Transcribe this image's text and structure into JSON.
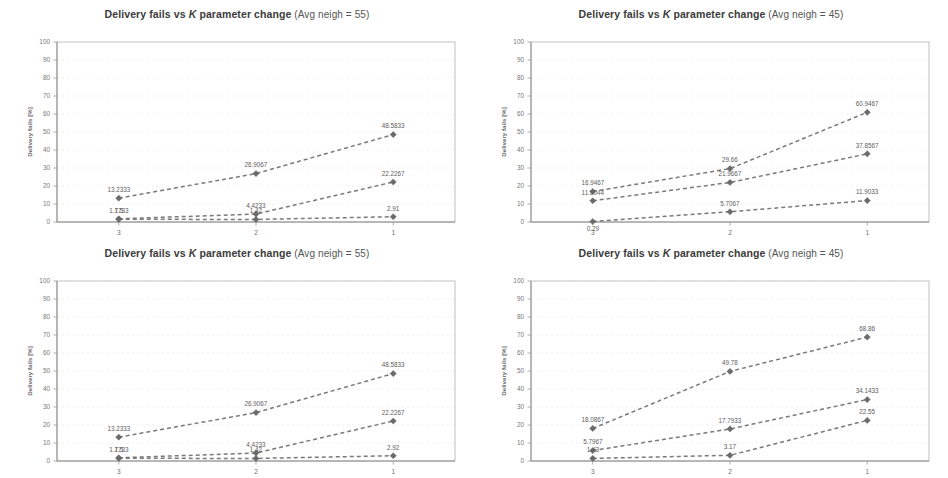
{
  "figure": {
    "width": 948,
    "height": 478,
    "background": "#ffffff",
    "panel_count": 4,
    "line_color": "#7a7a7a",
    "marker_color": "#6b6b6b",
    "grid_color": "#e8e8e8",
    "border_color": "#b9b9b9"
  },
  "chart_data": [
    {
      "id": "top-left",
      "type": "line",
      "title": "Delivery fails vs K parameter change",
      "subtitle": "(Avg neigh =  55)",
      "title_full": "Delivery fails vs K parameter change (Avg neigh =  55)",
      "xlabel": "",
      "ylabel": "Delivery fails [%]",
      "categories": [
        "3",
        "2",
        "1"
      ],
      "x": [
        3,
        2,
        1
      ],
      "xlim": [
        3.45,
        0.55
      ],
      "ylim": [
        0,
        100
      ],
      "yticks": [
        0,
        10,
        20,
        30,
        40,
        50,
        60,
        70,
        80,
        90,
        100
      ],
      "grid": true,
      "legend": "none",
      "series": [
        {
          "name": "series-1",
          "values": [
            13.2333,
            26.9067,
            48.5833
          ],
          "labels": [
            "13.2333",
            "26.9067",
            "48.5833"
          ],
          "label_pos": [
            "above",
            "above",
            "above"
          ]
        },
        {
          "name": "series-2",
          "values": [
            1.7733,
            4.4233,
            22.2267
          ],
          "labels": [
            "1.7733",
            "4.4233",
            "22.2267"
          ],
          "label_pos": [
            "above",
            "above",
            "above"
          ]
        },
        {
          "name": "series-3",
          "values": [
            1.5,
            1.42,
            2.91
          ],
          "labels": [
            "1.5",
            "1.42",
            "2.91"
          ],
          "label_pos": [
            "above",
            "above",
            "above"
          ]
        }
      ]
    },
    {
      "id": "top-right",
      "type": "line",
      "title": "Delivery fails vs K parameter change",
      "subtitle": "(Avg neigh = 45)",
      "title_full": "Delivery fails vs K parameter change (Avg neigh = 45)",
      "xlabel": "",
      "ylabel": "Delivery fails [%]",
      "categories": [
        "3",
        "2",
        "1"
      ],
      "x": [
        3,
        2,
        1
      ],
      "xlim": [
        3.45,
        0.55
      ],
      "ylim": [
        0,
        100
      ],
      "yticks": [
        0,
        10,
        20,
        30,
        40,
        50,
        60,
        70,
        80,
        90,
        100
      ],
      "grid": true,
      "legend": "none",
      "series": [
        {
          "name": "series-1",
          "values": [
            16.9467,
            29.66,
            60.9467
          ],
          "labels": [
            "16.9467",
            "29.66",
            "60.9467"
          ],
          "label_pos": [
            "above",
            "above",
            "above"
          ]
        },
        {
          "name": "series-2",
          "values": [
            11.8044,
            21.9667,
            37.8567
          ],
          "labels": [
            "11.8044",
            "21.9667",
            "37.8567"
          ],
          "label_pos": [
            "above",
            "above",
            "above"
          ]
        },
        {
          "name": "series-3",
          "values": [
            0.29,
            5.7067,
            11.9033
          ],
          "labels": [
            "0.29",
            "5.7067",
            "11.9033"
          ],
          "label_pos": [
            "below",
            "above",
            "above"
          ]
        }
      ]
    },
    {
      "id": "bottom-left",
      "type": "line",
      "title": "Delivery fails vs K parameter change",
      "subtitle": "(Avg neigh =  55)",
      "title_full": "Delivery fails vs K parameter change (Avg neigh =  55)",
      "xlabel": "",
      "ylabel": "Delivery fails [%]",
      "categories": [
        "3",
        "2",
        "1"
      ],
      "x": [
        3,
        2,
        1
      ],
      "xlim": [
        3.45,
        0.55
      ],
      "ylim": [
        0,
        100
      ],
      "yticks": [
        0,
        10,
        20,
        30,
        40,
        50,
        60,
        70,
        80,
        90,
        100
      ],
      "grid": true,
      "legend": "none",
      "series": [
        {
          "name": "series-1",
          "values": [
            13.2333,
            26.9067,
            48.5833
          ],
          "labels": [
            "13.2333",
            "26.9067",
            "48.5833"
          ],
          "label_pos": [
            "above",
            "above",
            "above"
          ]
        },
        {
          "name": "series-2",
          "values": [
            1.7733,
            4.4233,
            22.2267
          ],
          "labels": [
            "1.7733",
            "4.4233",
            "22.2267"
          ],
          "label_pos": [
            "above",
            "above",
            "above"
          ]
        },
        {
          "name": "series-3",
          "values": [
            1.5,
            1.42,
            2.92
          ],
          "labels": [
            "1.5",
            "1.42",
            "2.92"
          ],
          "label_pos": [
            "above",
            "above",
            "above"
          ]
        }
      ]
    },
    {
      "id": "bottom-right",
      "type": "line",
      "title": "Delivery fails vs K parameter change",
      "subtitle": "(Avg neigh = 45)",
      "title_full": "Delivery fails vs K parameter change (Avg neigh = 45)",
      "xlabel": "",
      "ylabel": "Delivery fails [%]",
      "categories": [
        "3",
        "2",
        "1"
      ],
      "x": [
        3,
        2,
        1
      ],
      "xlim": [
        3.45,
        0.55
      ],
      "ylim": [
        0,
        100
      ],
      "yticks": [
        0,
        10,
        20,
        30,
        40,
        50,
        60,
        70,
        80,
        90,
        100
      ],
      "grid": true,
      "legend": "none",
      "series": [
        {
          "name": "series-1",
          "values": [
            18.0867,
            49.78,
            68.86
          ],
          "labels": [
            "18.0867",
            "49.78",
            "68.86"
          ],
          "label_pos": [
            "above",
            "above",
            "above"
          ]
        },
        {
          "name": "series-2",
          "values": [
            5.7967,
            17.7933,
            34.1433
          ],
          "labels": [
            "5.7967",
            "17.7933",
            "34.1433"
          ],
          "label_pos": [
            "above",
            "above",
            "above"
          ]
        },
        {
          "name": "series-3",
          "values": [
            1.43,
            3.17,
            22.55
          ],
          "labels": [
            "1.43",
            "3.17",
            "22.55"
          ],
          "label_pos": [
            "above",
            "above",
            "above"
          ]
        }
      ]
    }
  ]
}
